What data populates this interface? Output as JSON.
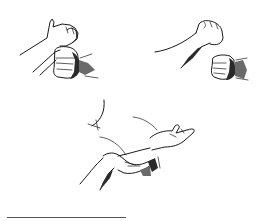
{
  "image": {
    "description": "Black-and-white line illustration of three hand technique panels",
    "panels": [
      {
        "id": "top-left",
        "subject": "open hand catching a fist from above"
      },
      {
        "id": "top-right",
        "subject": "raised fist with a second fist approaching from below"
      },
      {
        "id": "bottom-center",
        "subject": "hand grasping a forearm from beneath, palm-up open hand"
      }
    ],
    "colors": {
      "ink": "#1a1a1a",
      "background": "#ffffff",
      "rule": "#555555"
    }
  }
}
